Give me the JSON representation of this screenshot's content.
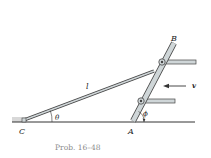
{
  "diagram": {
    "caption": "Prob. 16–48",
    "labels": {
      "point_b": "B",
      "point_a": "A",
      "point_c": "C",
      "length": "l",
      "theta": "θ",
      "phi": "ϕ",
      "velocity": "v"
    },
    "colors": {
      "ground": "#333333",
      "bar_fill": "#cfd6d8",
      "bar_stroke": "#444444",
      "caption": "#8a8a8a"
    }
  }
}
